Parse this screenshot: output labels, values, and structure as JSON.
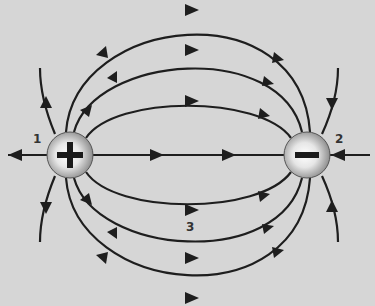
{
  "diagram": {
    "type": "electric-dipole-field-lines",
    "background": "#d6d6d6",
    "line_color": "#1e1e1e",
    "charges": [
      {
        "id": "positive",
        "sign": "+",
        "cx": 70,
        "cy": 155,
        "r": 23
      },
      {
        "id": "negative",
        "sign": "−",
        "cx": 307,
        "cy": 155,
        "r": 23
      }
    ],
    "labels": [
      {
        "id": "point-1",
        "text": "1",
        "x": 33,
        "y": 140
      },
      {
        "id": "point-2",
        "text": "2",
        "x": 335,
        "y": 140
      },
      {
        "id": "point-3",
        "text": "3",
        "x": 188,
        "y": 222
      }
    ]
  }
}
